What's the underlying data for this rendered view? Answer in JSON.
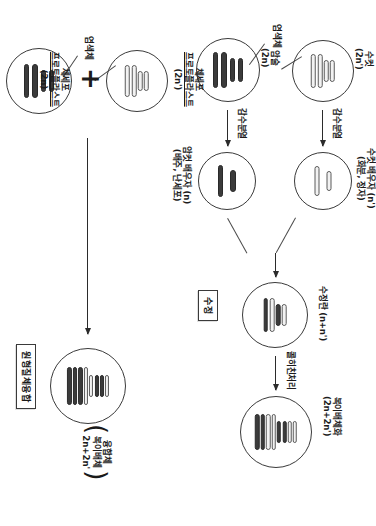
{
  "figure": {
    "orientation_degrees": 90,
    "panels": [
      {
        "id": "sexual-hybridization",
        "boxed_label": "수정",
        "nodes": [
          {
            "id": "male-parent",
            "label_line1": "수컷",
            "label_line2": "(2n')",
            "ploidy": "2n'",
            "chromosomes": "light"
          },
          {
            "id": "female-parent",
            "label_line1": "암술",
            "label_line2": "(2n)",
            "ploidy": "2n",
            "chromosomes": "dark"
          },
          {
            "id": "male-gamete",
            "label_line1": "수컷 배우자 (n')",
            "label_line2": "(화분, 정자)",
            "ploidy": "n'",
            "chromosomes": "light"
          },
          {
            "id": "female-gamete",
            "label_line1": "암컷 배우자 (n)",
            "label_line2": "(배주, 난세포)",
            "ploidy": "n",
            "chromosomes": "dark"
          },
          {
            "id": "zygote",
            "label_line1": "수정란 (n+n')",
            "label_line2": "",
            "ploidy": "n+n'",
            "chromosomes": "mixed"
          },
          {
            "id": "amphidiploid",
            "label_line1": "복이배체화",
            "label_line2": "(2n+2n')",
            "ploidy": "2n+2n'",
            "chromosomes": "mixed-doubled"
          }
        ],
        "arrows": [
          {
            "id": "meiosis-male",
            "label": "감수분열"
          },
          {
            "id": "meiosis-female",
            "label": "감수분열"
          },
          {
            "id": "fertilization",
            "label": ""
          },
          {
            "id": "colchicine",
            "label": "콜히친처리"
          }
        ],
        "chromosome_callout": "염색체"
      },
      {
        "id": "protoplast-fusion",
        "boxed_label": "원형질체융합",
        "plus_sign": "+",
        "nodes": [
          {
            "id": "protoplast-a",
            "label_line1": "체세포",
            "label_line2": "프로토플라스트",
            "label_line3": "(2n')",
            "ploidy": "2n'",
            "chromosomes": "light"
          },
          {
            "id": "protoplast-b",
            "label_line1": "체세포",
            "label_line2": "프로토플라스트",
            "label_line3": "(2n)",
            "ploidy": "2n",
            "chromosomes": "dark"
          },
          {
            "id": "fusion-product",
            "label_line1": "융합체",
            "label_line2": "복이배체",
            "label_line3": "2n+2n'",
            "ploidy": "2n+2n'",
            "chromosomes": "mixed-doubled"
          }
        ],
        "chromosome_callout": "염색체"
      }
    ],
    "colors": {
      "ink": "#2b2b2b",
      "outline": "#3a3a3a",
      "chromosome_light": "#f2f2f2",
      "chromosome_dark": "#3b3b3b",
      "background": "#ffffff"
    }
  }
}
